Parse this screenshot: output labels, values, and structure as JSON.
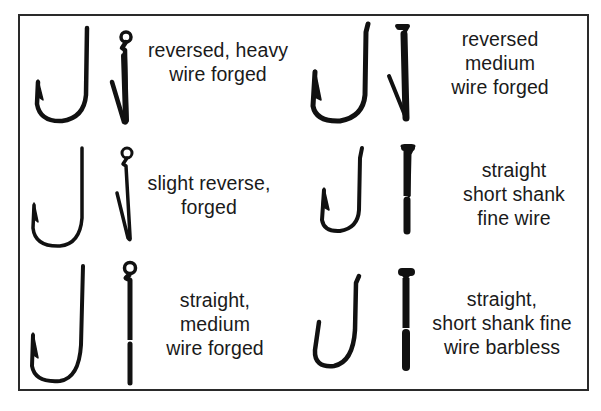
{
  "diagram": {
    "type": "fish hook styles comparison",
    "layout": "3 rows x 2 columns, each cell shows side view and front view of a hook with a text label",
    "border_color": "#2a2a2a",
    "ink_color": "#111111",
    "cells": [
      {
        "position": "row1-left",
        "lines": [
          "reversed, heavy",
          "wire forged"
        ],
        "eye_style": "ringed eye"
      },
      {
        "position": "row1-right",
        "lines": [
          "reversed",
          "medium",
          "wire forged"
        ],
        "eye_style": "tapered spade end"
      },
      {
        "position": "row2-left",
        "lines": [
          "slight reverse,",
          "forged"
        ],
        "eye_style": "ringed eye"
      },
      {
        "position": "row2-right",
        "lines": [
          "straight",
          "short shank",
          "fine wire"
        ],
        "eye_style": "tapered spade end"
      },
      {
        "position": "row3-left",
        "lines": [
          "straight,",
          "medium",
          "wire forged"
        ],
        "eye_style": "ringed eye"
      },
      {
        "position": "row3-right",
        "lines": [
          "straight,",
          "short shank fine",
          "wire barbless"
        ],
        "eye_style": "tapered spade end"
      }
    ]
  }
}
